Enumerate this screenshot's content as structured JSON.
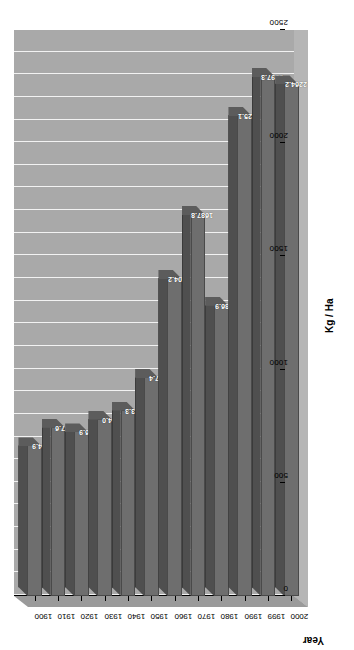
{
  "chart_data": {
    "type": "bar",
    "orientation": "vertical-rotated",
    "title": "",
    "xlabel": "Year",
    "ylabel": "Kg / Ha",
    "categories": [
      "1900",
      "1910",
      "1920",
      "1930",
      "1940",
      "1950",
      "1960",
      "1970",
      "1980",
      "1990",
      "1999",
      "2000"
    ],
    "values": [
      664.9,
      747.6,
      726.9,
      784.0,
      823.3,
      967.4,
      1404.2,
      1687.8,
      1286.9,
      2125.1,
      2297.3,
      2264.2
    ],
    "value_labels": [
      "664.9",
      "747.6",
      "726.9",
      "784.0",
      "823.3",
      "967.4",
      "1404.2",
      "1687.8",
      "1286.9",
      "2125.1",
      "2297.3",
      "2264.2"
    ],
    "ylim": [
      0,
      2500
    ],
    "ytick_labels": [
      "0",
      "500",
      "1000",
      "1500",
      "2000",
      "2500"
    ],
    "ytick_values": [
      0,
      500,
      1000,
      1500,
      2000,
      2500
    ],
    "grid": true,
    "legend": false,
    "colors": {
      "bar_front": "#6e6e6e",
      "bar_top": "#4f4f4f",
      "plot_background": "#a9a9a9",
      "gridline": "#ffffff",
      "axis": "#000000",
      "label_text": "#ffffff",
      "page_background": "#ffffff"
    }
  }
}
